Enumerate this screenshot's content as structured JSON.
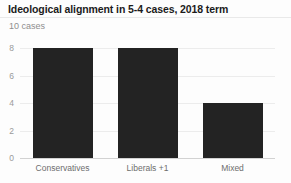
{
  "header": {
    "title": "Ideological alignment in 5-4 cases, 2018 term",
    "subtitle": "10 cases"
  },
  "colors": {
    "bar": "#232323",
    "grid": "#ececec",
    "axis": "#d2d2d2",
    "title": "#1b1b1b",
    "subtitle": "#8e8e8e",
    "tick": "#9a9a9a",
    "category": "#6d6d6d",
    "background": "#fdfdfd"
  },
  "chart_data": {
    "type": "bar",
    "title": "Ideological alignment in 5-4 cases, 2018 term",
    "subtitle": "10 cases",
    "xlabel": "",
    "ylabel": "",
    "categories": [
      "Conservatives",
      "Liberals +1",
      "Mixed"
    ],
    "values": [
      8,
      8,
      4
    ],
    "ylim": [
      0,
      8.6
    ],
    "yticks": [
      0,
      2,
      4,
      6,
      8
    ],
    "ytick_labels": [
      "0",
      "2",
      "4",
      "6",
      "8"
    ],
    "grid": true,
    "legend": false,
    "legend_position": "none"
  }
}
